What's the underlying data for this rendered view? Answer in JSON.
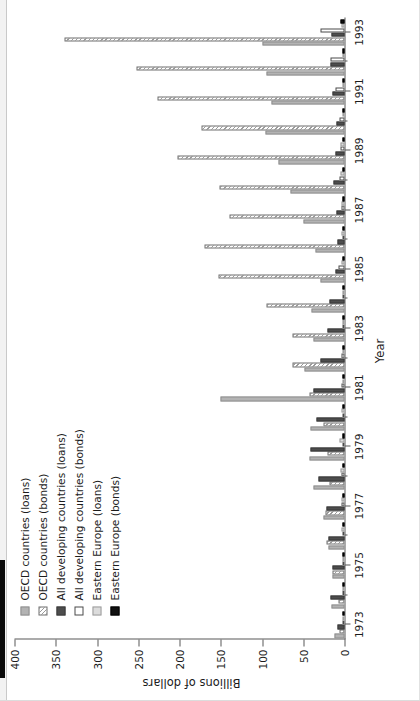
{
  "chart_data": {
    "type": "bar",
    "orientation": "horizontal",
    "title": "",
    "xlabel": "Year",
    "ylabel": "Billions of dollars",
    "ylim": [
      0,
      400
    ],
    "yticks": [
      0,
      50,
      100,
      150,
      200,
      250,
      300,
      350,
      400
    ],
    "grid": false,
    "legend_position": "upper-left",
    "categories": [
      "1973",
      "1974",
      "1975",
      "1976",
      "1977",
      "1978",
      "1979",
      "1980",
      "1981",
      "1982",
      "1983",
      "1984",
      "1985",
      "1986",
      "1987",
      "1988",
      "1989",
      "1990",
      "1991",
      "1992",
      "1993"
    ],
    "tick_labels": [
      "1973",
      "1975",
      "1977",
      "1979",
      "1981",
      "1983",
      "1985",
      "1987",
      "1989",
      "1991",
      "1993"
    ],
    "series": [
      {
        "name": "OECD countries (loans)",
        "swatch": "#b3b3b3",
        "pattern": "solid-light",
        "values": [
          12,
          16,
          14,
          19,
          25,
          38,
          42,
          41,
          150,
          48,
          38,
          40,
          29,
          35,
          50,
          65,
          80,
          96,
          88,
          94,
          100
        ]
      },
      {
        "name": "OECD countries (bonds)",
        "swatch": "#9a9a9a",
        "pattern": "hatched",
        "values": [
          6,
          7,
          15,
          22,
          23,
          18,
          21,
          25,
          43,
          63,
          63,
          94,
          153,
          170,
          139,
          152,
          202,
          173,
          227,
          252,
          340
        ]
      },
      {
        "name": "All developing countries (loans)",
        "swatch": "#4d4d4d",
        "pattern": "solid-dark",
        "values": [
          9,
          17,
          15,
          20,
          22,
          32,
          41,
          34,
          37,
          29,
          21,
          18,
          11,
          9,
          10,
          13,
          11,
          10,
          14,
          17,
          16
        ]
      },
      {
        "name": "All developing countries (bonds)",
        "swatch": "#ffffff",
        "pattern": "white",
        "values": [
          1,
          1,
          1,
          2,
          4,
          4,
          3,
          2,
          4,
          4,
          2,
          3,
          7,
          3,
          4,
          6,
          5,
          6,
          11,
          17,
          29
        ]
      },
      {
        "name": "Eastern Europe (loans)",
        "swatch": "#dcdcdc",
        "pattern": "solid-vlight",
        "values": [
          1,
          2,
          3,
          4,
          4,
          5,
          6,
          4,
          3,
          1,
          2,
          3,
          4,
          4,
          4,
          5,
          5,
          3,
          3,
          3,
          4
        ]
      },
      {
        "name": "Eastern Europe (bonds)",
        "swatch": "#111111",
        "pattern": "solid-black",
        "values": [
          0,
          0,
          0,
          0,
          0,
          0,
          0,
          0,
          0,
          0,
          0,
          0,
          1,
          1,
          1,
          2,
          2,
          1,
          2,
          3,
          5
        ]
      }
    ]
  },
  "axes": {
    "y_title": "Billions of dollars",
    "x_title": "Year"
  }
}
